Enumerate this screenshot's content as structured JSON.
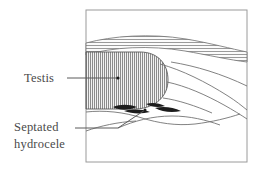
{
  "figure": {
    "background_color": "#ffffff",
    "frame": {
      "name": "diagram-frame",
      "x": 86,
      "y": 10,
      "width": 161,
      "height": 152,
      "stroke_color": "#9a9a9a",
      "fill_color": "#ffffff"
    },
    "ink_color": "#555555",
    "dark_ink_color": "#1c1c1c",
    "hatch_color": "#8c8c8c"
  },
  "labels": [
    {
      "id": "testis",
      "name": "label-testis",
      "lines": [
        "Testis"
      ],
      "text_x": 24,
      "text_y": 82,
      "leader": {
        "name": "leader-line-testis",
        "points": "67,78 118,78",
        "end_dot": {
          "cx": 118,
          "cy": 78,
          "r": 1.6
        }
      }
    },
    {
      "id": "septated-hydrocele",
      "name": "label-septated-hydrocele",
      "lines": [
        "Septated",
        "hydrocele"
      ],
      "text_x": 14,
      "text_y": 131,
      "line_height": 17,
      "leader": {
        "name": "leader-line-septated-hydrocele",
        "points": "75,128 118,128 145,110",
        "end_dot": {
          "cx": 145,
          "cy": 110,
          "r": 1.5
        }
      }
    }
  ],
  "structures": [
    {
      "id": "scrotal-wall-band",
      "name": "scrotal-wall-band",
      "description": "Hatched band across upper portion representing scrotal wall",
      "hatch": "horizontal",
      "path": "M86,43 C112,36 150,33 186,39 C210,43 232,49 247,52 L247,62 C230,60 208,55 185,51 C150,45 112,47 86,55 Z"
    },
    {
      "id": "testis-body",
      "name": "testis-body",
      "description": "Oval testis with dense vertical hatching, flattened at left frame edge",
      "hatch": "vertical",
      "path": "M86,52 L140,52 C158,52 168,64 168,80 C168,96 156,108 136,109 L86,109 Z"
    },
    {
      "id": "epididymis-curve",
      "name": "epididymis-curve",
      "description": "Curved outline sweeping to lower right from testis",
      "paths": [
        "M160,64 C182,70 206,82 228,96 C236,101 242,106 247,110",
        "M167,82 C186,86 206,95 224,105 C233,110 241,115 247,119",
        "M163,98 C178,100 196,106 212,113",
        "M171,62 C196,66 222,74 247,86"
      ]
    },
    {
      "id": "hydrocele-cavity",
      "name": "hydrocele-cavity",
      "description": "Fluid cavity outline below the testis containing septa",
      "paths": [
        "M86,112 C104,110 124,112 142,118 C158,123 176,126 195,124 C212,122 228,118 240,114",
        "M86,131 C100,126 118,122 136,121",
        "M118,128 C134,121 152,116 172,116 C190,116 206,120 220,125"
      ]
    }
  ],
  "septa": [
    {
      "id": "septum-1",
      "name": "septum-stroke",
      "path": "M113,107 C120,104 129,104 137,107 C130,110 120,111 113,107 Z"
    },
    {
      "id": "septum-2",
      "name": "septum-stroke",
      "path": "M124,111 C132,109 142,109 150,112 C142,114 132,114 124,111 Z"
    },
    {
      "id": "septum-3",
      "name": "septum-stroke",
      "path": "M155,108 C163,106 173,107 181,111 C172,113 162,112 155,108 Z"
    },
    {
      "id": "septum-4",
      "name": "septum-stroke",
      "path": "M146,104 C152,102 159,103 165,106 C158,108 151,107 146,104 Z"
    }
  ]
}
